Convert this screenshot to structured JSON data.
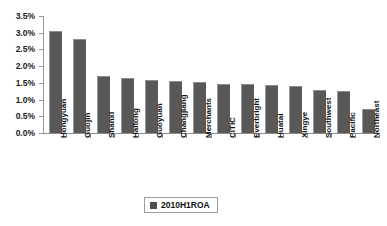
{
  "chart_data": {
    "type": "bar",
    "title": "",
    "xlabel": "",
    "ylabel": "",
    "ylim": [
      0,
      3.5
    ],
    "y_tick_labels": [
      "3.5%",
      "3.0%",
      "2.5%",
      "2.0%",
      "1.5%",
      "1.0%",
      "0.5%",
      "0.0%"
    ],
    "y_tick_values": [
      3.5,
      3.0,
      2.5,
      2.0,
      1.5,
      1.0,
      0.5,
      0.0
    ],
    "grid": false,
    "legend_position": "bottom-center",
    "categories": [
      "Hongyuan",
      "Guojin",
      "Shanxi",
      "Haitong",
      "Guoyuan",
      "Changjiang",
      "Merchants",
      "CITIC",
      "Everbright",
      "Huatai",
      "Xingye",
      "Southwest",
      "Pacific",
      "Northeast"
    ],
    "series": [
      {
        "name": "2010H1ROA",
        "color": "#585858",
        "values": [
          3.05,
          2.8,
          1.7,
          1.65,
          1.6,
          1.57,
          1.52,
          1.48,
          1.48,
          1.45,
          1.42,
          1.3,
          1.25,
          0.72
        ]
      }
    ]
  },
  "legend": {
    "entries": [
      {
        "label": "2010H1ROA",
        "swatch_color": "#4f4f4f"
      }
    ]
  },
  "axis": {
    "y_axis_color": "#9a9a9a",
    "x_axis_color": "#8e8e8e"
  }
}
